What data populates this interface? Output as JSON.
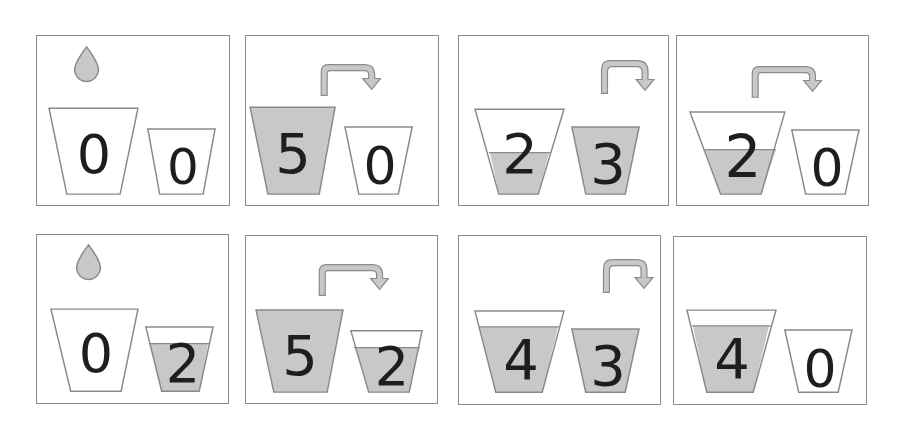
{
  "colors": {
    "water": "#c8c8c8",
    "outline": "#8a8a8a",
    "digit": "#1e1e1e",
    "frame": "#8a8a8a"
  },
  "cups": {
    "big_capacity": 5,
    "small_capacity": 3
  },
  "steps": [
    {
      "index": 1,
      "action": "fill",
      "action_icon": "drop-icon",
      "big": "0",
      "small": "0",
      "big_level": 0,
      "small_level": 0
    },
    {
      "index": 2,
      "action": "pour-big-to-small",
      "action_icon": "pour-arrow-icon",
      "big": "5",
      "small": "0",
      "big_level": 5,
      "small_level": 0
    },
    {
      "index": 3,
      "action": "empty-small",
      "action_icon": "pour-arrow-icon",
      "big": "2",
      "small": "3",
      "big_level": 2,
      "small_level": 3
    },
    {
      "index": 4,
      "action": "pour-big-to-small",
      "action_icon": "pour-arrow-icon",
      "big": "2",
      "small": "0",
      "big_level": 2,
      "small_level": 0
    },
    {
      "index": 5,
      "action": "fill",
      "action_icon": "drop-icon",
      "big": "0",
      "small": "2",
      "big_level": 0,
      "small_level": 2
    },
    {
      "index": 6,
      "action": "pour-big-to-small",
      "action_icon": "pour-arrow-icon",
      "big": "5",
      "small": "2",
      "big_level": 5,
      "small_level": 2
    },
    {
      "index": 7,
      "action": "empty-small",
      "action_icon": "pour-arrow-icon",
      "big": "4",
      "small": "3",
      "big_level": 4,
      "small_level": 3
    },
    {
      "index": 8,
      "action": "none",
      "action_icon": "",
      "big": "4",
      "small": "0",
      "big_level": 4,
      "small_level": 0
    }
  ]
}
